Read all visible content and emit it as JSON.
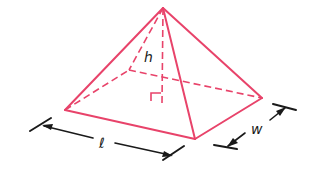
{
  "diagram": {
    "labels": {
      "height": "h",
      "length": "ℓ",
      "width": "w"
    },
    "colors": {
      "edges": "#e8436a",
      "dimensions": "#1a1a1a",
      "background": "#ffffff"
    },
    "vertices": {
      "apex": [
        163,
        8
      ],
      "front_left": [
        65,
        110
      ],
      "front_right": [
        195,
        139
      ],
      "back_right": [
        262,
        98
      ],
      "back_left": [
        129,
        70
      ],
      "height_foot": [
        162,
        103
      ]
    }
  }
}
